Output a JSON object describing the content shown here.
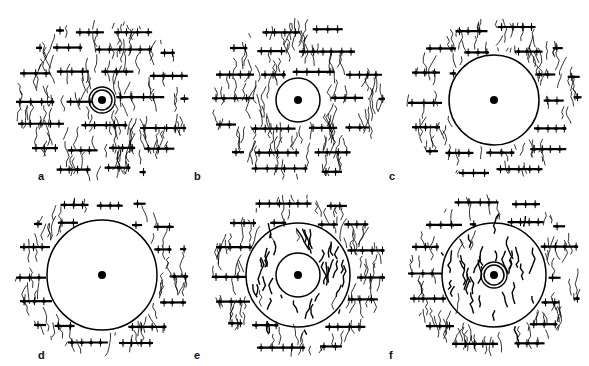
{
  "figure": {
    "panels": [
      {
        "label": "a",
        "description": "small cavity with ring in dendritic network",
        "inner_ring_r": 10,
        "outer_ring_r": 0,
        "cavity_r": 10,
        "center_ring": true,
        "inner_network": false
      },
      {
        "label": "b",
        "description": "medium cavity",
        "inner_ring_r": 0,
        "outer_ring_r": 0,
        "cavity_r": 22,
        "center_ring": false,
        "inner_network": false
      },
      {
        "label": "c",
        "description": "large cavity",
        "inner_ring_r": 0,
        "outer_ring_r": 0,
        "cavity_r": 45,
        "center_ring": false,
        "inner_network": false
      },
      {
        "label": "d",
        "description": "largest cavity",
        "inner_ring_r": 0,
        "outer_ring_r": 0,
        "cavity_r": 55,
        "center_ring": false,
        "inner_network": false
      },
      {
        "label": "e",
        "description": "regrowth with inner cavity",
        "inner_ring_r": 22,
        "outer_ring_r": 52,
        "cavity_r": 22,
        "center_ring": false,
        "inner_network": true
      },
      {
        "label": "f",
        "description": "regrowth with small ring",
        "inner_ring_r": 10,
        "outer_ring_r": 52,
        "cavity_r": 10,
        "center_ring": true,
        "inner_network": true
      }
    ]
  }
}
